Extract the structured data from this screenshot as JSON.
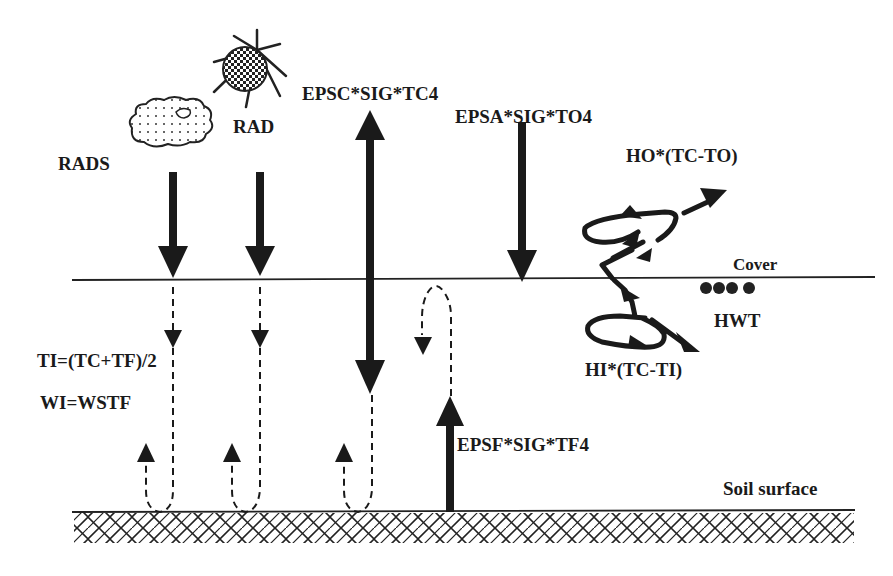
{
  "diagram": {
    "type": "energy-balance schematic",
    "labels": {
      "rads": "RADS",
      "rad": "RAD",
      "epsc": "EPSC*SIG*TC4",
      "epsa": "EPSA*SIG*TO4",
      "ho": "HO*(TC-TO)",
      "cover": "Cover",
      "hwt": "HWT",
      "hi": "HI*(TC-TI)",
      "ti": "TI=(TC+TF)/2",
      "wi": "WI=WSTF",
      "epsf": "EPSF*SIG*TF4",
      "soil": "Soil surface"
    },
    "icons": [
      "cloud-icon",
      "sun-icon",
      "water-droplets-icon"
    ],
    "layers": [
      "Cover",
      "Soil surface"
    ],
    "colors": {
      "ink": "#1a1a1a",
      "background": "#ffffff"
    }
  }
}
